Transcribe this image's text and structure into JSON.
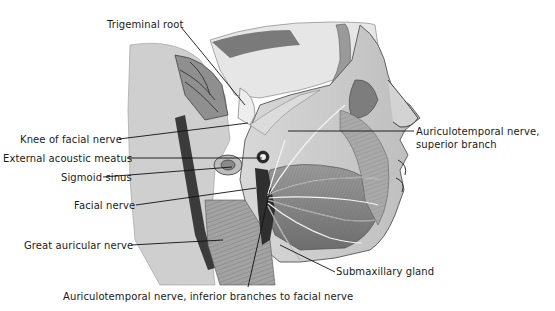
{
  "figure": {
    "labels": [
      {
        "id": "trigeminal-root",
        "text": "Trigeminal root",
        "x": 107,
        "y": 19,
        "align": "left"
      },
      {
        "id": "knee-of-facial-nerve",
        "text": "Knee of facial nerve",
        "x": 20,
        "y": 134,
        "align": "left"
      },
      {
        "id": "external-acoustic-meatus",
        "text": "External acoustic meatus",
        "x": 3,
        "y": 153,
        "align": "left"
      },
      {
        "id": "sigmoid-sinus",
        "text": "Sigmoid sinus",
        "x": 61,
        "y": 172,
        "align": "left"
      },
      {
        "id": "facial-nerve",
        "text": "Facial nerve",
        "x": 74,
        "y": 200,
        "align": "left"
      },
      {
        "id": "great-auricular-nerve",
        "text": "Great auricular nerve",
        "x": 24,
        "y": 240,
        "align": "left"
      },
      {
        "id": "auriculotemporal-superior-1",
        "text": "Auriculotemporal nerve,",
        "x": 416,
        "y": 132,
        "align": "left"
      },
      {
        "id": "auriculotemporal-superior-2",
        "text": "superior branch",
        "x": 416,
        "y": 145,
        "align": "left"
      },
      {
        "id": "submaxillary-gland",
        "text": "Submaxillary gland",
        "x": 336,
        "y": 271,
        "align": "left"
      },
      {
        "id": "auriculotemporal-inferior",
        "text": "Auriculotemporal nerve, inferior branches to facial nerve",
        "x": 63,
        "y": 291,
        "align": "left"
      }
    ]
  }
}
